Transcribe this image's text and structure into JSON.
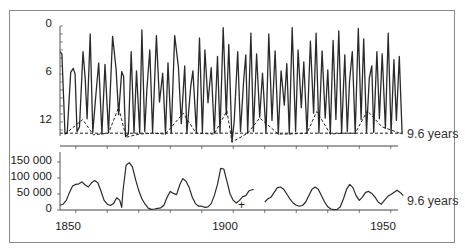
{
  "chart_data": [
    {
      "type": "line",
      "title": "",
      "xlabel": "",
      "ylabel": "",
      "ylim": [
        13.5,
        0
      ],
      "y_inverted": true,
      "yticks": [
        "0",
        "6",
        "12"
      ],
      "xlim": [
        1845,
        1955
      ],
      "annotation": "9.6 years",
      "series": [
        {
          "name": "light curve",
          "style": "solid",
          "points": [
            [
              1845.0,
              3.2
            ],
            [
              1845.6,
              3.5
            ],
            [
              1846.6,
              13.5
            ],
            [
              1847.3,
              13.4
            ],
            [
              1848.4,
              5.8
            ],
            [
              1849.2,
              5.3
            ],
            [
              1849.8,
              6.0
            ],
            [
              1850.4,
              13.2
            ],
            [
              1851.2,
              12.6
            ],
            [
              1852.3,
              3.2
            ],
            [
              1853.0,
              6.6
            ],
            [
              1853.6,
              11.6
            ],
            [
              1854.6,
              1.0
            ],
            [
              1855.4,
              13.3
            ],
            [
              1856.3,
              9.0
            ],
            [
              1857.3,
              4.6
            ],
            [
              1858.3,
              13.5
            ],
            [
              1859.3,
              4.8
            ],
            [
              1860.4,
              13.3
            ],
            [
              1861.7,
              1.3
            ],
            [
              1862.8,
              5.4
            ],
            [
              1863.6,
              11.1
            ],
            [
              1864.6,
              5.7
            ],
            [
              1865.2,
              6.3
            ],
            [
              1865.8,
              13.8
            ],
            [
              1866.7,
              13.5
            ],
            [
              1867.6,
              3.2
            ],
            [
              1868.5,
              13.4
            ],
            [
              1869.3,
              5.6
            ],
            [
              1870.3,
              13.4
            ],
            [
              1871.0,
              0.5
            ],
            [
              1871.9,
              13.2
            ],
            [
              1872.6,
              7.9
            ],
            [
              1873.5,
              3.0
            ],
            [
              1874.4,
              13.3
            ],
            [
              1875.6,
              1.2
            ],
            [
              1876.6,
              9.5
            ],
            [
              1877.6,
              5.9
            ],
            [
              1878.5,
              13.5
            ],
            [
              1879.3,
              4.6
            ],
            [
              1880.3,
              13.4
            ],
            [
              1881.4,
              1.2
            ],
            [
              1882.6,
              5.1
            ],
            [
              1883.5,
              12.2
            ],
            [
              1884.6,
              5.0
            ],
            [
              1885.3,
              13.4
            ],
            [
              1886.5,
              7.6
            ],
            [
              1887.2,
              5.6
            ],
            [
              1888.3,
              13.3
            ],
            [
              1889.3,
              1.5
            ],
            [
              1890.2,
              13.3
            ],
            [
              1891.0,
              3.0
            ],
            [
              1892.0,
              9.6
            ],
            [
              1893.0,
              5.2
            ],
            [
              1894.0,
              13.4
            ],
            [
              1895.0,
              3.8
            ],
            [
              1895.8,
              13.4
            ],
            [
              1896.8,
              0.2
            ],
            [
              1897.8,
              11.1
            ],
            [
              1898.6,
              2.3
            ],
            [
              1899.6,
              14.5
            ],
            [
              1900.3,
              11.9
            ],
            [
              1901.4,
              3.2
            ],
            [
              1902.3,
              13.2
            ],
            [
              1903.3,
              6.9
            ],
            [
              1904.0,
              3.6
            ],
            [
              1904.6,
              13.4
            ],
            [
              1905.6,
              0.9
            ],
            [
              1906.4,
              13.2
            ],
            [
              1907.4,
              3.5
            ],
            [
              1908.4,
              11.4
            ],
            [
              1909.3,
              5.9
            ],
            [
              1910.4,
              13.4
            ],
            [
              1911.3,
              1.0
            ],
            [
              1912.3,
              11.8
            ],
            [
              1913.3,
              3.1
            ],
            [
              1914.3,
              13.5
            ],
            [
              1915.2,
              5.6
            ],
            [
              1916.2,
              9.9
            ],
            [
              1917.0,
              4.7
            ],
            [
              1917.8,
              13.5
            ],
            [
              1918.7,
              0.2
            ],
            [
              1919.8,
              13.2
            ],
            [
              1920.6,
              3.0
            ],
            [
              1921.6,
              10.2
            ],
            [
              1922.4,
              4.5
            ],
            [
              1923.4,
              13.4
            ],
            [
              1924.5,
              1.9
            ],
            [
              1925.5,
              10.9
            ],
            [
              1926.3,
              0.9
            ],
            [
              1927.2,
              13.4
            ],
            [
              1928.2,
              3.1
            ],
            [
              1929.2,
              11.5
            ],
            [
              1930.0,
              5.5
            ],
            [
              1930.8,
              13.5
            ],
            [
              1931.7,
              1.8
            ],
            [
              1932.6,
              11.7
            ],
            [
              1933.5,
              0.6
            ],
            [
              1934.4,
              13.4
            ],
            [
              1935.4,
              3.6
            ],
            [
              1936.2,
              13.2
            ],
            [
              1936.9,
              7.0
            ],
            [
              1937.8,
              3.2
            ],
            [
              1938.7,
              13.4
            ],
            [
              1939.7,
              0.3
            ],
            [
              1940.6,
              11.7
            ],
            [
              1941.4,
              1.6
            ],
            [
              1942.3,
              13.3
            ],
            [
              1943.2,
              6.5
            ],
            [
              1944.0,
              5.0
            ],
            [
              1944.6,
              13.3
            ],
            [
              1945.6,
              3.2
            ],
            [
              1946.4,
              11.6
            ],
            [
              1947.3,
              3.5
            ],
            [
              1948.3,
              12.8
            ],
            [
              1949.2,
              0.9
            ],
            [
              1950.1,
              13.4
            ],
            [
              1951.0,
              4.2
            ],
            [
              1951.8,
              11.8
            ],
            [
              1952.7,
              3.8
            ],
            [
              1953.6,
              13.5
            ]
          ]
        },
        {
          "name": "minima envelope",
          "style": "dashed",
          "points": [
            [
              1846.6,
              13.5
            ],
            [
              1852.2,
              11.7
            ],
            [
              1855.6,
              13.6
            ],
            [
              1860.4,
              13.4
            ],
            [
              1863.6,
              10.2
            ],
            [
              1866.0,
              13.9
            ],
            [
              1870.3,
              13.5
            ],
            [
              1874.4,
              13.4
            ],
            [
              1878.5,
              13.5
            ],
            [
              1884.1,
              10.9
            ],
            [
              1888.2,
              13.4
            ],
            [
              1894.0,
              13.5
            ],
            [
              1898.0,
              10.6
            ],
            [
              1899.6,
              14.5
            ],
            [
              1904.6,
              13.4
            ],
            [
              1908.4,
              11.5
            ],
            [
              1914.3,
              13.5
            ],
            [
              1917.8,
              13.5
            ],
            [
              1923.4,
              13.4
            ],
            [
              1926.5,
              10.7
            ],
            [
              1930.8,
              13.5
            ],
            [
              1934.4,
              13.4
            ],
            [
              1938.7,
              13.4
            ],
            [
              1942.6,
              10.6
            ],
            [
              1947.2,
              12.6
            ],
            [
              1953.6,
              13.5
            ]
          ]
        },
        {
          "name": "9.6 years baseline",
          "style": "dashed",
          "points": [
            [
              1845.0,
              13.4
            ],
            [
              1953.6,
              13.4
            ]
          ]
        }
      ]
    },
    {
      "type": "line",
      "title": "",
      "xlabel": "",
      "ylabel": "",
      "ylim": [
        0,
        170000
      ],
      "yticks": [
        "0",
        "50 000",
        "100 000",
        "150 000"
      ],
      "xlim": [
        1845,
        1955
      ],
      "xticks": [
        "1850",
        "1900",
        "1950"
      ],
      "annotation": "9.6 years",
      "marker": {
        "label": "+",
        "x": 1907.0,
        "y": 12000
      },
      "series": [
        {
          "name": "counts (segment 1)",
          "points": [
            [
              1845.0,
              15000
            ],
            [
              1846.0,
              18000
            ],
            [
              1847.0,
              30000
            ],
            [
              1848.0,
              55000
            ],
            [
              1849.0,
              75000
            ],
            [
              1850.0,
              80000
            ],
            [
              1851.0,
              82000
            ],
            [
              1852.0,
              88000
            ],
            [
              1853.0,
              78000
            ],
            [
              1854.0,
              72000
            ],
            [
              1855.0,
              85000
            ],
            [
              1856.0,
              92000
            ],
            [
              1857.0,
              85000
            ],
            [
              1858.0,
              60000
            ],
            [
              1859.0,
              30000
            ],
            [
              1860.0,
              18000
            ],
            [
              1861.0,
              14000
            ],
            [
              1862.0,
              20000
            ],
            [
              1863.0,
              38000
            ],
            [
              1864.0,
              30000
            ],
            [
              1864.6,
              8000
            ],
            [
              1865.0,
              60000
            ],
            [
              1866.0,
              140000
            ],
            [
              1867.0,
              148000
            ],
            [
              1868.0,
              135000
            ],
            [
              1869.0,
              95000
            ],
            [
              1870.0,
              60000
            ],
            [
              1871.0,
              35000
            ],
            [
              1872.0,
              18000
            ],
            [
              1873.0,
              6000
            ],
            [
              1874.0,
              2000
            ],
            [
              1875.0,
              3000
            ],
            [
              1876.0,
              5000
            ],
            [
              1877.0,
              7000
            ],
            [
              1878.0,
              15000
            ],
            [
              1879.0,
              40000
            ],
            [
              1880.0,
              58000
            ],
            [
              1881.0,
              52000
            ],
            [
              1882.0,
              48000
            ],
            [
              1883.0,
              78000
            ],
            [
              1884.0,
              98000
            ],
            [
              1885.0,
              90000
            ],
            [
              1886.0,
              70000
            ],
            [
              1887.0,
              40000
            ],
            [
              1888.0,
              20000
            ],
            [
              1889.0,
              12000
            ],
            [
              1890.0,
              12000
            ],
            [
              1891.0,
              8000
            ],
            [
              1892.0,
              10000
            ],
            [
              1893.0,
              20000
            ],
            [
              1894.0,
              45000
            ],
            [
              1895.0,
              80000
            ],
            [
              1896.0,
              130000
            ],
            [
              1897.0,
              128000
            ],
            [
              1898.0,
              90000
            ],
            [
              1899.0,
              50000
            ],
            [
              1900.0,
              30000
            ],
            [
              1901.0,
              22000
            ],
            [
              1902.0,
              30000
            ],
            [
              1903.0,
              42000
            ],
            [
              1904.0,
              45000
            ],
            [
              1905.0,
              60000
            ],
            [
              1906.0,
              63000
            ],
            [
              1906.5,
              65000
            ]
          ]
        },
        {
          "name": "counts (segment 2)",
          "points": [
            [
              1886.6,
              20000
            ]
          ]
        }
      ]
    }
  ],
  "top_panel": {
    "yticks": [
      {
        "label": "0",
        "v": 0
      },
      {
        "label": "6",
        "v": 6
      },
      {
        "label": "12",
        "v": 12
      }
    ],
    "annotation": "9.6 years"
  },
  "bottom_panel": {
    "yticks": [
      {
        "label": "150 000",
        "v": 150000
      },
      {
        "label": "100 000",
        "v": 100000
      },
      {
        "label": "50 000",
        "v": 50000
      },
      {
        "label": "0",
        "v": 0
      }
    ],
    "xticks": [
      {
        "label": "1850",
        "year": 1850
      },
      {
        "label": "1900",
        "year": 1900
      },
      {
        "label": "1950",
        "year": 1950
      }
    ],
    "annotation": "9.6 years",
    "plus_marker": "+"
  }
}
